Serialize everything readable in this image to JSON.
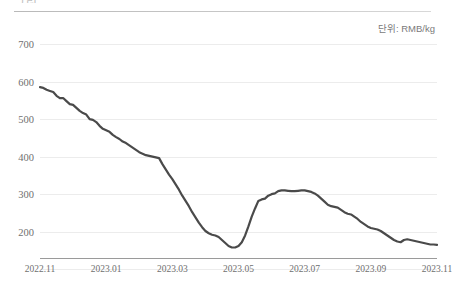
{
  "page": {
    "title_partial": "그림  ",
    "footnote": ""
  },
  "unit": {
    "label": "단위: RMB/kg"
  },
  "chart_data": {
    "type": "line",
    "title": "",
    "xlabel": "",
    "ylabel": "",
    "unit": "RMB/kg",
    "ylim": [
      130,
      700
    ],
    "yticks": [
      700,
      600,
      500,
      400,
      300,
      200
    ],
    "grid": true,
    "legend": "none",
    "line_color": "#4a4a4a",
    "grid_color": "#ececec",
    "axis_color": "#9a9a9a",
    "xticks": [
      "2022.11",
      "2023.01",
      "2023.03",
      "2023.05",
      "2023.07",
      "2023.09",
      "2023.11"
    ],
    "xtick_positions": [
      0.0,
      0.1667,
      0.3333,
      0.5,
      0.6667,
      0.8333,
      1.0
    ],
    "x_start": "2022.11",
    "x_end": "2023.12",
    "series": [
      {
        "name": "price",
        "values": [
          585,
          583,
          578,
          575,
          572,
          562,
          556,
          556,
          548,
          540,
          538,
          530,
          522,
          516,
          512,
          500,
          498,
          492,
          482,
          474,
          470,
          466,
          458,
          452,
          447,
          440,
          436,
          430,
          424,
          418,
          412,
          408,
          404,
          402,
          400,
          398,
          396,
          380,
          366,
          352,
          340,
          326,
          312,
          296,
          282,
          268,
          252,
          238,
          224,
          212,
          202,
          196,
          192,
          190,
          186,
          178,
          170,
          162,
          158,
          158,
          162,
          172,
          190,
          214,
          240,
          262,
          282,
          286,
          288,
          296,
          300,
          302,
          308,
          310,
          310,
          309,
          308,
          308,
          309,
          310,
          310,
          308,
          306,
          302,
          296,
          288,
          280,
          272,
          268,
          266,
          264,
          258,
          252,
          248,
          246,
          240,
          234,
          226,
          220,
          214,
          210,
          208,
          206,
          202,
          196,
          190,
          184,
          178,
          174,
          172,
          178,
          180,
          178,
          176,
          174,
          172,
          170,
          168,
          166,
          166,
          165
        ]
      }
    ]
  }
}
